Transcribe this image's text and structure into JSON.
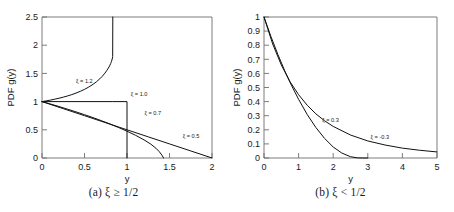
{
  "figure": {
    "background": "#ffffff",
    "line_color": "#111111",
    "axis_color": "#6e6e6e"
  },
  "panels": [
    {
      "id": "a",
      "caption": "(a) ξ ≥ 1/2",
      "chart_data": {
        "type": "line",
        "title": "",
        "xlabel": "y",
        "ylabel": "PDF g(y)",
        "xlim": [
          0,
          2
        ],
        "ylim": [
          0,
          2.5
        ],
        "xticks": [
          0,
          0.5,
          1,
          1.5,
          2
        ],
        "xticklabels": [
          "0",
          "0.5",
          "1",
          "1.5",
          "2"
        ],
        "yticks": [
          0,
          0.5,
          1,
          1.5,
          2,
          2.5
        ],
        "yticklabels": [
          "0",
          "0.5",
          "1",
          "1.5",
          "2",
          "2.5"
        ],
        "grid": false,
        "legend": "inline-annotations",
        "series": [
          {
            "name": "ξ = 1.2",
            "label": "ξ = 1.2",
            "label_pos": [
              0.4,
              1.33
            ],
            "x": [
              0.0,
              0.05,
              0.1,
              0.15,
              0.2,
              0.25,
              0.3,
              0.35,
              0.4,
              0.45,
              0.5,
              0.55,
              0.6,
              0.64,
              0.68,
              0.71,
              0.74,
              0.76,
              0.78,
              0.795,
              0.808,
              0.818,
              0.826,
              0.8315,
              0.833
            ],
            "y": [
              1.0,
              1.013,
              1.027,
              1.043,
              1.06,
              1.079,
              1.1,
              1.124,
              1.151,
              1.182,
              1.217,
              1.258,
              1.306,
              1.351,
              1.404,
              1.45,
              1.504,
              1.546,
              1.593,
              1.633,
              1.675,
              1.714,
              1.756,
              1.8,
              2.5
            ]
          },
          {
            "name": "ξ = 1.0",
            "label": "ξ = 1.0",
            "label_pos": [
              1.045,
              1.105
            ],
            "x": [
              0.0,
              0.833,
              0.833,
              1.0,
              1.0
            ],
            "y": [
              1.0,
              1.0,
              1.0,
              1.0,
              0.0
            ],
            "note": "uniform density on [0,1] drawn with vertical drop at y=1"
          },
          {
            "name": "ξ = 0.7",
            "label": "ξ = 0.7",
            "label_pos": [
              1.205,
              0.765
            ],
            "x": [
              0.0,
              0.1,
              0.2,
              0.3,
              0.4,
              0.5,
              0.6,
              0.7,
              0.8,
              0.9,
              1.0,
              1.1,
              1.2,
              1.28,
              1.34,
              1.38,
              1.41,
              1.425,
              1.4285
            ],
            "y": [
              1.0,
              0.957,
              0.912,
              0.866,
              0.818,
              0.768,
              0.716,
              0.661,
              0.603,
              0.541,
              0.475,
              0.403,
              0.322,
              0.246,
              0.174,
              0.112,
              0.052,
              0.016,
              0.0
            ]
          },
          {
            "name": "ξ = 0.5",
            "label": "ξ = 0.5",
            "label_pos": [
              1.655,
              0.355
            ],
            "x": [
              0.0,
              0.25,
              0.5,
              0.75,
              1.0,
              1.25,
              1.5,
              1.75,
              2.0
            ],
            "y": [
              1.0,
              0.875,
              0.75,
              0.625,
              0.5,
              0.375,
              0.25,
              0.125,
              0.0
            ]
          }
        ]
      }
    },
    {
      "id": "b",
      "caption": "(b) ξ < 1/2",
      "chart_data": {
        "type": "line",
        "title": "",
        "xlabel": "y",
        "ylabel": "PDF g(y)",
        "xlim": [
          0,
          5
        ],
        "ylim": [
          0,
          1
        ],
        "xticks": [
          0,
          1,
          2,
          3,
          4,
          5
        ],
        "xticklabels": [
          "0",
          "1",
          "2",
          "3",
          "4",
          "5"
        ],
        "yticks": [
          0,
          0.1,
          0.2,
          0.3,
          0.4,
          0.5,
          0.6,
          0.7,
          0.8,
          0.9,
          1
        ],
        "yticklabels": [
          "0",
          "0.1",
          "0.2",
          "0.3",
          "0.4",
          "0.5",
          "0.6",
          "0.7",
          "0.8",
          "0.9",
          "1"
        ],
        "grid": false,
        "legend": "inline-annotations",
        "series": [
          {
            "name": "ξ = 0.3",
            "label": "ξ = 0.3",
            "label_pos": [
              1.68,
              0.255
            ],
            "x": [
              0.0,
              0.2,
              0.4,
              0.6,
              0.8,
              1.0,
              1.25,
              1.5,
              1.75,
              2.0,
              2.25,
              2.5,
              2.7,
              2.85,
              2.95,
              3.0
            ],
            "y": [
              1.0,
              0.862,
              0.735,
              0.618,
              0.512,
              0.416,
              0.308,
              0.216,
              0.139,
              0.078,
              0.035,
              0.009,
              0.001,
              0.0,
              0.0,
              0.0
            ]
          },
          {
            "name": "ξ = -0.3",
            "label": "ξ = -0.3",
            "label_pos": [
              3.08,
              0.135
            ],
            "x": [
              0.0,
              0.25,
              0.5,
              0.75,
              1.0,
              1.25,
              1.5,
              1.75,
              2.0,
              2.5,
              3.0,
              3.5,
              4.0,
              4.5,
              5.0
            ],
            "y": [
              1.0,
              0.809,
              0.66,
              0.542,
              0.449,
              0.374,
              0.313,
              0.264,
              0.224,
              0.163,
              0.121,
              0.092,
              0.07,
              0.055,
              0.043
            ]
          }
        ]
      }
    }
  ]
}
